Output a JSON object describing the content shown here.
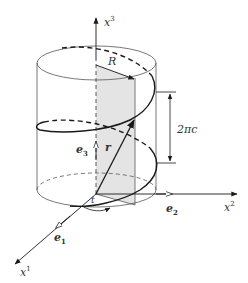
{
  "diagram": {
    "colors": {
      "stroke": "#1a1a1a",
      "shade": "#e4e4e4",
      "label": "#333333"
    },
    "labels": {
      "x3_axis": {
        "base": "x",
        "sup": "3"
      },
      "x2_axis": {
        "base": "x",
        "sup": "2"
      },
      "x1_axis": {
        "base": "x",
        "sup": "1"
      },
      "radius": "R",
      "pitch": "2πc",
      "e3": {
        "base": "e",
        "sub": "3"
      },
      "e2": {
        "base": "e",
        "sub": "2"
      },
      "e1": {
        "base": "e",
        "sub": "1"
      },
      "position_vector": "r",
      "angle": "t"
    },
    "elements": [
      "cylinder",
      "helix-curve",
      "x1-axis",
      "x2-axis",
      "x3-axis",
      "basis-vector-e1",
      "basis-vector-e2",
      "basis-vector-e3",
      "position-vector-r",
      "radius-arrow-R",
      "pitch-dimension-2pic",
      "shaded-meridian-plane",
      "angle-arc-t"
    ]
  }
}
